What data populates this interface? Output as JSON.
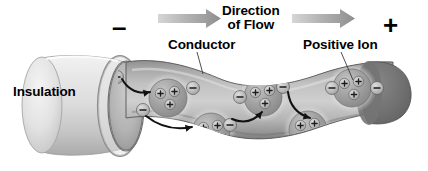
{
  "figure": {
    "background_color": "#ffffff",
    "style": "grayscale scientific illustration"
  },
  "labels": {
    "insulation": "Insulation",
    "conductor": "Conductor",
    "direction_line1": "Direction",
    "direction_line2": "of Flow",
    "positive_ion": "Positive Ion",
    "negative_terminal": "–",
    "positive_terminal": "+"
  },
  "colors": {
    "insulation_light": "#e8e8e8",
    "insulation_mid": "#cfcfcf",
    "insulation_dark": "#a8a8a8",
    "conductor_light": "#cfcfcf",
    "conductor_mid": "#a5a5a5",
    "conductor_dark": "#6f6f6f",
    "end_cap_dark": "#6e6e6e",
    "ion_core": "#9a9a9a",
    "ion_halo": "#e4e4e4",
    "electron_fill": "#bdbdbd",
    "arrow_gray": "#a9a9a9",
    "outline": "#3a3a3a",
    "text": "#000000"
  },
  "flow_arrows": [
    {
      "name": "flow-arrow-left",
      "x": 158,
      "y": 17,
      "length": 62,
      "direction": "right"
    },
    {
      "name": "flow-arrow-right",
      "x": 292,
      "y": 17,
      "length": 62,
      "direction": "right"
    }
  ],
  "positive_ions": [
    {
      "id": 1,
      "cx": 168,
      "cy": 98,
      "r": 19,
      "charges": 3,
      "charge_symbol": "+"
    },
    {
      "id": 2,
      "cx": 211,
      "cy": 132,
      "r": 19,
      "charges": 3,
      "charge_symbol": "+"
    },
    {
      "id": 3,
      "cx": 263,
      "cy": 97,
      "r": 19,
      "charges": 3,
      "charge_symbol": "+"
    },
    {
      "id": 4,
      "cx": 308,
      "cy": 130,
      "r": 19,
      "charges": 3,
      "charge_symbol": "+"
    },
    {
      "id": 5,
      "cx": 352,
      "cy": 88,
      "r": 19,
      "charges": 3,
      "charge_symbol": "+"
    }
  ],
  "electrons": [
    {
      "id": 1,
      "cx": 117,
      "cy": 77,
      "r": 6.5,
      "charge_symbol": "–"
    },
    {
      "id": 2,
      "cx": 143,
      "cy": 110,
      "r": 6.5,
      "charge_symbol": "–"
    },
    {
      "id": 3,
      "cx": 193,
      "cy": 88,
      "r": 6.5,
      "charge_symbol": "–"
    },
    {
      "id": 4,
      "cx": 187,
      "cy": 145,
      "r": 6.5,
      "charge_symbol": "–"
    },
    {
      "id": 5,
      "cx": 230,
      "cy": 125,
      "r": 6.5,
      "charge_symbol": "–"
    },
    {
      "id": 6,
      "cx": 240,
      "cy": 97,
      "r": 6.5,
      "charge_symbol": "–"
    },
    {
      "id": 7,
      "cx": 283,
      "cy": 87,
      "r": 6.5,
      "charge_symbol": "–"
    },
    {
      "id": 8,
      "cx": 284,
      "cy": 143,
      "r": 6.5,
      "charge_symbol": "–"
    },
    {
      "id": 9,
      "cx": 332,
      "cy": 88,
      "r": 6.5,
      "charge_symbol": "–"
    },
    {
      "id": 10,
      "cx": 377,
      "cy": 88,
      "r": 6.5,
      "charge_symbol": "–"
    }
  ],
  "electron_paths": [
    {
      "id": 1,
      "from": [
        122,
        79
      ],
      "to": [
        150,
        92
      ],
      "label": "electron-jump-1"
    },
    {
      "id": 2,
      "from": [
        146,
        116
      ],
      "to": [
        192,
        127
      ],
      "label": "electron-jump-2"
    },
    {
      "id": 3,
      "from": [
        232,
        119
      ],
      "to": [
        262,
        112
      ],
      "label": "electron-jump-3"
    },
    {
      "id": 4,
      "from": [
        288,
        92
      ],
      "to": [
        310,
        118
      ],
      "label": "electron-jump-4"
    }
  ],
  "leader_lines": [
    {
      "name": "conductor-leader",
      "from": [
        197,
        52
      ],
      "to": [
        202,
        72
      ]
    },
    {
      "name": "positive-ion-leader",
      "from": [
        341,
        52
      ],
      "to": [
        352,
        80
      ]
    }
  ]
}
